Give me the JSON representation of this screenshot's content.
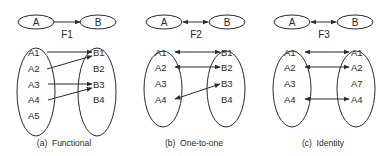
{
  "colors": {
    "ink": "#2a2a2a",
    "background": "#ffffff"
  },
  "panels": [
    {
      "id": "a",
      "top": {
        "left": "A",
        "right": "B",
        "relation": "F1",
        "arrow": "one-way"
      },
      "left_set": [
        "A1",
        "A2",
        "A3",
        "A4",
        "A5"
      ],
      "right_set": [
        "B1",
        "B2",
        "B3",
        "B4"
      ],
      "mappings": [
        {
          "from": "A1",
          "to": "B1",
          "type": "one-way"
        },
        {
          "from": "A2",
          "to": "B1",
          "type": "one-way"
        },
        {
          "from": "A3",
          "to": "B3",
          "type": "one-way"
        },
        {
          "from": "A4",
          "to": "B3",
          "type": "one-way"
        }
      ],
      "caption": "(a)  Functional"
    },
    {
      "id": "b",
      "top": {
        "left": "A",
        "right": "B",
        "relation": "F2",
        "arrow": "two-way"
      },
      "left_set": [
        "A1",
        "A2",
        "A3",
        "A4"
      ],
      "right_set": [
        "B1",
        "B2",
        "B3",
        "B4"
      ],
      "mappings": [
        {
          "from": "A1",
          "to": "B1",
          "type": "two-way"
        },
        {
          "from": "A2",
          "to": "B2",
          "type": "two-way"
        },
        {
          "from": "A4",
          "to": "B3",
          "type": "two-way"
        }
      ],
      "caption": "(b)  One-to-one"
    },
    {
      "id": "c",
      "top": {
        "left": "A",
        "right": "B",
        "relation": "F3",
        "arrow": "two-way"
      },
      "left_set": [
        "A1",
        "A2",
        "A3",
        "A4"
      ],
      "right_set": [
        "A1",
        "A2",
        "A7",
        "A4"
      ],
      "mappings": [
        {
          "from": "A1",
          "to": "A1",
          "type": "two-way"
        },
        {
          "from": "A2",
          "to": "A2",
          "type": "two-way"
        },
        {
          "from": "A4",
          "to": "A4",
          "type": "two-way"
        }
      ],
      "caption": "(c)  Identity"
    }
  ]
}
